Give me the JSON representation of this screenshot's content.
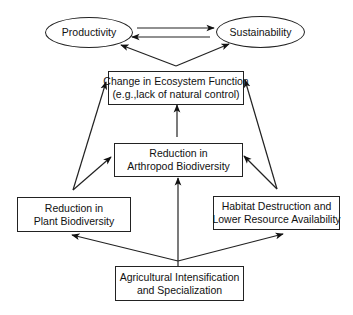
{
  "diagram": {
    "type": "flow-diagram",
    "nodes": {
      "productivity": {
        "label": "Productivity"
      },
      "sustainability": {
        "label": "Sustainability"
      },
      "ecosystem": {
        "line1": "Change in Ecosystem Function",
        "line2": "(e.g.,lack of natural control)"
      },
      "arthropod": {
        "line1": "Reduction in",
        "line2": "Arthropod Biodiversity"
      },
      "plant": {
        "line1": "Reduction in",
        "line2": "Plant Biodiversity"
      },
      "habitat": {
        "line1": "Habitat Destruction and",
        "line2": "Lower Resource Availability"
      },
      "agriculture": {
        "line1": "Agricultural Intensification",
        "line2": "and Specialization"
      }
    },
    "edges": [
      {
        "from": "Productivity",
        "to": "Sustainability"
      },
      {
        "from": "Sustainability",
        "to": "Productivity"
      },
      {
        "from": "Change in Ecosystem Function",
        "to": "Productivity"
      },
      {
        "from": "Change in Ecosystem Function",
        "to": "Sustainability"
      },
      {
        "from": "Reduction in Arthropod Biodiversity",
        "to": "Change in Ecosystem Function"
      },
      {
        "from": "Reduction in Plant Biodiversity",
        "to": "Change in Ecosystem Function"
      },
      {
        "from": "Reduction in Plant Biodiversity",
        "to": "Reduction in Arthropod Biodiversity"
      },
      {
        "from": "Habitat Destruction and Lower Resource Availability",
        "to": "Change in Ecosystem Function"
      },
      {
        "from": "Habitat Destruction and Lower Resource Availability",
        "to": "Reduction in Arthropod Biodiversity"
      },
      {
        "from": "Agricultural Intensification and Specialization",
        "to": "Reduction in Plant Biodiversity"
      },
      {
        "from": "Agricultural Intensification and Specialization",
        "to": "Reduction in Arthropod Biodiversity"
      },
      {
        "from": "Agricultural Intensification and Specialization",
        "to": "Habitat Destruction and Lower Resource Availability"
      }
    ]
  }
}
